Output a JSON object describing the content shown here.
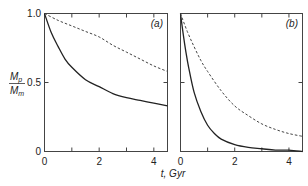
{
  "chart_data": [
    {
      "type": "line",
      "panel_label": "(a)",
      "xlabel": "t, Gyr",
      "ylabel": {
        "main": "M",
        "sub_top": "p",
        "sub_bottom": "m"
      },
      "xlim": [
        0,
        4.5
      ],
      "ylim": [
        0,
        1.0
      ],
      "xticks": [
        0,
        1,
        2,
        3,
        4
      ],
      "xtick_labels": [
        "0",
        "",
        "2",
        "",
        "4"
      ],
      "yticks": [
        0,
        0.5,
        1.0
      ],
      "ytick_labels": [
        "0",
        "0.5",
        "1.0"
      ],
      "grid": false,
      "series": [
        {
          "name": "solid",
          "style": "solid",
          "x": [
            0,
            0.25,
            0.5,
            0.75,
            1.0,
            1.5,
            2.0,
            2.5,
            3.0,
            3.5,
            4.0,
            4.5
          ],
          "y": [
            1.0,
            0.86,
            0.76,
            0.67,
            0.61,
            0.52,
            0.47,
            0.42,
            0.39,
            0.37,
            0.35,
            0.33
          ]
        },
        {
          "name": "dashed",
          "style": "dashed",
          "x": [
            0,
            0.5,
            1.0,
            1.5,
            2.0,
            2.5,
            3.0,
            3.5,
            4.0,
            4.5
          ],
          "y": [
            1.0,
            0.95,
            0.91,
            0.87,
            0.83,
            0.77,
            0.72,
            0.67,
            0.62,
            0.58
          ]
        }
      ]
    },
    {
      "type": "line",
      "panel_label": "(b)",
      "xlim": [
        0,
        4.5
      ],
      "ylim": [
        0,
        1.0
      ],
      "xticks": [
        0,
        1,
        2,
        3,
        4
      ],
      "xtick_labels": [
        "0",
        "",
        "2",
        "",
        "4"
      ],
      "yticks": [
        0,
        0.5,
        1.0
      ],
      "grid": false,
      "series": [
        {
          "name": "solid",
          "style": "solid",
          "x": [
            0,
            0.1,
            0.2,
            0.3,
            0.5,
            0.75,
            1.0,
            1.25,
            1.5,
            2.0,
            2.5,
            3.0,
            3.5,
            4.0,
            4.5
          ],
          "y": [
            1.0,
            0.85,
            0.72,
            0.61,
            0.43,
            0.29,
            0.19,
            0.13,
            0.09,
            0.05,
            0.03,
            0.02,
            0.01,
            0.01,
            0.0
          ]
        },
        {
          "name": "dashed",
          "style": "dashed",
          "x": [
            0,
            0.25,
            0.5,
            0.75,
            1.0,
            1.5,
            2.0,
            2.5,
            3.0,
            3.5,
            4.0,
            4.5
          ],
          "y": [
            1.0,
            0.87,
            0.76,
            0.66,
            0.58,
            0.44,
            0.33,
            0.26,
            0.2,
            0.16,
            0.13,
            0.11
          ]
        }
      ]
    }
  ]
}
